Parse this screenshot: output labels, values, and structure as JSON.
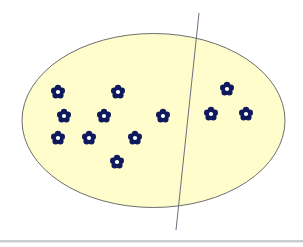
{
  "diagram": {
    "title": "",
    "colors": {
      "set_fill": "#fffdcc",
      "set_stroke": "#6e6e6e",
      "divider_stroke": "#6a6f80",
      "flower_fill": "#0f1a5c",
      "flower_center": "#ffffff",
      "bottom_rule": "#c9ccd1"
    },
    "set": {
      "label": ""
    },
    "divider": {
      "label": ""
    },
    "groups": [
      {
        "name": "left-subset",
        "count": 9
      },
      {
        "name": "right-subset",
        "count": 3
      }
    ],
    "elements": [
      {
        "group": "left-subset",
        "icon": "flower-icon"
      },
      {
        "group": "left-subset",
        "icon": "flower-icon"
      },
      {
        "group": "left-subset",
        "icon": "flower-icon"
      },
      {
        "group": "left-subset",
        "icon": "flower-icon"
      },
      {
        "group": "left-subset",
        "icon": "flower-icon"
      },
      {
        "group": "left-subset",
        "icon": "flower-icon"
      },
      {
        "group": "left-subset",
        "icon": "flower-icon"
      },
      {
        "group": "left-subset",
        "icon": "flower-icon"
      },
      {
        "group": "left-subset",
        "icon": "flower-icon"
      },
      {
        "group": "right-subset",
        "icon": "flower-icon"
      },
      {
        "group": "right-subset",
        "icon": "flower-icon"
      },
      {
        "group": "right-subset",
        "icon": "flower-icon"
      }
    ]
  }
}
